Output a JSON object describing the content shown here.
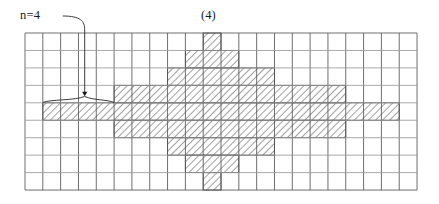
{
  "figure": {
    "caption_number": "(4)",
    "annotation_label": "n=4",
    "annotation_icon": "curved-leader-line-with-brace",
    "colors": {
      "grid_line": "#555555",
      "grid_line_light": "#9a9a9a",
      "hatch_stroke": "#8a8a8a",
      "hatch_border": "#4a4a4a",
      "text": "#1a1a1a",
      "background": "#ffffff"
    },
    "grid": {
      "cols": 22,
      "rows": 9,
      "origin_x": 25,
      "origin_y": 33,
      "cell_w": 17.82,
      "cell_h": 17.45
    },
    "shaded_runs": [
      {
        "row": 0,
        "start": 10,
        "end": 10
      },
      {
        "row": 1,
        "start": 9,
        "end": 11
      },
      {
        "row": 2,
        "start": 8,
        "end": 13
      },
      {
        "row": 3,
        "start": 5,
        "end": 17
      },
      {
        "row": 4,
        "start": 1,
        "end": 20
      },
      {
        "row": 5,
        "start": 5,
        "end": 17
      },
      {
        "row": 6,
        "start": 8,
        "end": 13
      },
      {
        "row": 7,
        "start": 9,
        "end": 11
      },
      {
        "row": 8,
        "start": 10,
        "end": 10
      }
    ],
    "brace": {
      "row": 3,
      "start_col": 1,
      "end_col": 5,
      "pointer_col": 3
    }
  },
  "chart_data": {
    "type": "heatmap",
    "title": "(4)",
    "xlabel": "",
    "ylabel": "",
    "grid": true,
    "legend": "none",
    "annotations": [
      "n=4"
    ],
    "categories": [
      "c0",
      "c1",
      "c2",
      "c3",
      "c4",
      "c5",
      "c6",
      "c7",
      "c8",
      "c9",
      "c10",
      "c11",
      "c12",
      "c13",
      "c14",
      "c15",
      "c16",
      "c17",
      "c18",
      "c19",
      "c20",
      "c21"
    ],
    "series": [
      {
        "name": "row0",
        "values": [
          0,
          0,
          0,
          0,
          0,
          0,
          0,
          0,
          0,
          0,
          1,
          0,
          0,
          0,
          0,
          0,
          0,
          0,
          0,
          0,
          0,
          0
        ]
      },
      {
        "name": "row1",
        "values": [
          0,
          0,
          0,
          0,
          0,
          0,
          0,
          0,
          0,
          1,
          1,
          1,
          0,
          0,
          0,
          0,
          0,
          0,
          0,
          0,
          0,
          0
        ]
      },
      {
        "name": "row2",
        "values": [
          0,
          0,
          0,
          0,
          0,
          0,
          0,
          0,
          1,
          1,
          1,
          1,
          1,
          1,
          0,
          0,
          0,
          0,
          0,
          0,
          0,
          0
        ]
      },
      {
        "name": "row3",
        "values": [
          0,
          0,
          0,
          0,
          0,
          1,
          1,
          1,
          1,
          1,
          1,
          1,
          1,
          1,
          1,
          1,
          1,
          1,
          0,
          0,
          0,
          0
        ]
      },
      {
        "name": "row4",
        "values": [
          0,
          1,
          1,
          1,
          1,
          1,
          1,
          1,
          1,
          1,
          1,
          1,
          1,
          1,
          1,
          1,
          1,
          1,
          1,
          1,
          1,
          0
        ]
      },
      {
        "name": "row5",
        "values": [
          0,
          0,
          0,
          0,
          0,
          1,
          1,
          1,
          1,
          1,
          1,
          1,
          1,
          1,
          1,
          1,
          1,
          1,
          0,
          0,
          0,
          0
        ]
      },
      {
        "name": "row6",
        "values": [
          0,
          0,
          0,
          0,
          0,
          0,
          0,
          0,
          1,
          1,
          1,
          1,
          1,
          1,
          0,
          0,
          0,
          0,
          0,
          0,
          0,
          0
        ]
      },
      {
        "name": "row7",
        "values": [
          0,
          0,
          0,
          0,
          0,
          0,
          0,
          0,
          0,
          1,
          1,
          1,
          0,
          0,
          0,
          0,
          0,
          0,
          0,
          0,
          0,
          0
        ]
      },
      {
        "name": "row8",
        "values": [
          0,
          0,
          0,
          0,
          0,
          0,
          0,
          0,
          0,
          0,
          1,
          0,
          0,
          0,
          0,
          0,
          0,
          0,
          0,
          0,
          0,
          0
        ]
      }
    ]
  }
}
